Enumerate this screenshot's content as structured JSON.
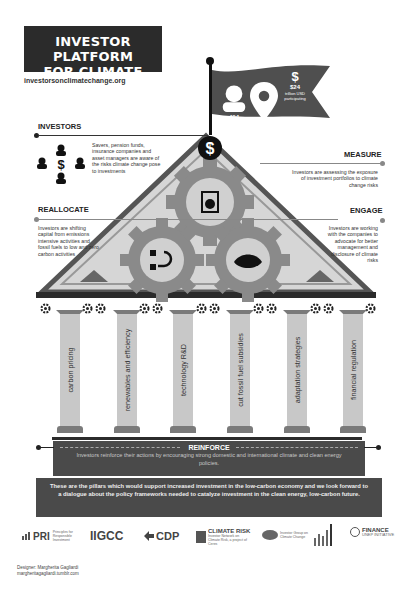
{
  "header": {
    "title_line1": "INVESTOR PLATFORM",
    "title_line2": "FOR CLIMATE ACTIONS",
    "website": "investorsonclimatechange.org"
  },
  "flag": {
    "stats": [
      {
        "icon": "person-icon",
        "value": "404",
        "label": "investors"
      },
      {
        "icon": "location-pin-icon",
        "value": "40",
        "label": "countries"
      },
      {
        "icon": "dollar-icon",
        "value": "$24",
        "label": "trillion USD participating"
      }
    ]
  },
  "sections": {
    "investors": {
      "label": "INVESTORS",
      "text": "Savers, pension funds, insurance companies and asset managers are aware of the risks climate change pose to investments"
    },
    "measure": {
      "label": "MEASURE",
      "text": "Investors are assessing the exposure of investment portfolios to climate change risks"
    },
    "reallocate": {
      "label": "REALLOCATE",
      "text": "Investors are shifting capital from emissions intensive activities and fossil fuels to low and zero carbon activities"
    },
    "engage": {
      "label": "ENGAGE",
      "text": "Investors are working with the companies to advocate for better management and disclosure of climate risks"
    }
  },
  "pillars": [
    {
      "label": "carbon pricing"
    },
    {
      "label": "renewables and efficiency"
    },
    {
      "label": "technology R&D"
    },
    {
      "label": "cut fossil fuel subsidies"
    },
    {
      "label": "adaptation strategies"
    },
    {
      "label": "financial regulation"
    }
  ],
  "reinforce": {
    "title": "REINFORCE",
    "text": "Investors reinforce their actions by encouraging strong domestic and international climate and clean energy policies."
  },
  "pillars_note": "These are the pillars which would support increased investment in the low-carbon economy and we look forward to a dialogue about the policy frameworks needed to catalyze investment in the clean energy, low-carbon future.",
  "logos": [
    {
      "name": "PRI",
      "subtitle": "Principles for Responsible Investment"
    },
    {
      "name": "IIGCC",
      "subtitle": ""
    },
    {
      "name": "CDP",
      "subtitle": ""
    },
    {
      "name": "CLIMATE RISK",
      "subtitle": "Investor Network on Climate Risk, a project of Ceres"
    },
    {
      "name": "IGCC",
      "subtitle": "Investor Group on Climate Change"
    },
    {
      "name": "AIGCC",
      "subtitle": ""
    },
    {
      "name": "FINANCE",
      "subtitle": "UNEP INITIATIVE"
    }
  ],
  "designer": {
    "line1": "Designer: Margherita Gagliardi",
    "line2": "margheritagagliardi.tumblr.com"
  }
}
